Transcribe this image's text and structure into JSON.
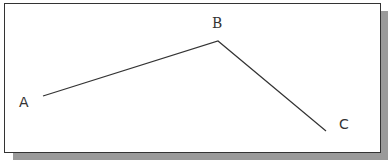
{
  "diagram": {
    "points": [
      {
        "label": "A",
        "x": 43,
        "y": 96
      },
      {
        "label": "B",
        "x": 218,
        "y": 41
      },
      {
        "label": "C",
        "x": 326,
        "y": 131
      }
    ],
    "line_color": "#333333",
    "frame_shadow_color": "#9a9a9a"
  }
}
